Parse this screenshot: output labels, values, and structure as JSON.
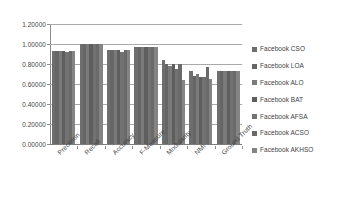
{
  "chart_data": {
    "type": "bar",
    "title": "",
    "subtitle": "",
    "xlabel": "",
    "ylabel": "",
    "ylim": [
      0,
      1.2
    ],
    "ytick_labels": [
      "1.20000",
      "1.00000",
      "0.80000",
      "0.60000",
      "0.40000",
      "0.20000",
      "0.00000"
    ],
    "ytick_values": [
      1.2,
      1.0,
      0.8,
      0.6,
      0.4,
      0.2,
      0.0
    ],
    "grid": true,
    "legend_position": "right",
    "orientation": "vertical",
    "grouping": "grouped",
    "categories": [
      "Precision",
      "Recall",
      "Accuracy",
      "F-Measure",
      "Modularity",
      "NMI",
      "Ground Truth"
    ],
    "series": [
      {
        "name": "Facebook CSO",
        "color": "#6e6e6e",
        "values": [
          0.935,
          1.0,
          0.94,
          0.967,
          0.84,
          0.735,
          0.732
        ]
      },
      {
        "name": "Facebook LOA",
        "color": "#666666",
        "values": [
          0.935,
          1.0,
          0.94,
          0.967,
          0.8,
          0.685,
          0.732
        ]
      },
      {
        "name": "Facebook ALO",
        "color": "#7a7a7a",
        "values": [
          0.935,
          1.0,
          0.94,
          0.967,
          0.78,
          0.705,
          0.732
        ]
      },
      {
        "name": "Facebook BAT",
        "color": "#5e5e5e",
        "values": [
          0.935,
          1.0,
          0.94,
          0.967,
          0.8,
          0.675,
          0.732
        ]
      },
      {
        "name": "Facebook AFSA",
        "color": "#727272",
        "values": [
          0.92,
          1.0,
          0.92,
          0.967,
          0.755,
          0.675,
          0.732
        ]
      },
      {
        "name": "Facebook ACSO",
        "color": "#6a6a6a",
        "values": [
          0.935,
          1.0,
          0.94,
          0.967,
          0.8,
          0.775,
          0.732
        ]
      },
      {
        "name": "Facebook AKHSO",
        "color": "#848484",
        "values": [
          0.935,
          1.0,
          0.94,
          0.967,
          0.645,
          0.655,
          0.732
        ]
      }
    ]
  },
  "legend": {
    "items": [
      {
        "label": "Facebook CSO"
      },
      {
        "label": "Facebook LOA"
      },
      {
        "label": "Facebook ALO"
      },
      {
        "label": "Facebook BAT"
      },
      {
        "label": "Facebook AFSA"
      },
      {
        "label": "Facebook ACSO"
      },
      {
        "label": "Facebook AKHSO"
      }
    ]
  }
}
